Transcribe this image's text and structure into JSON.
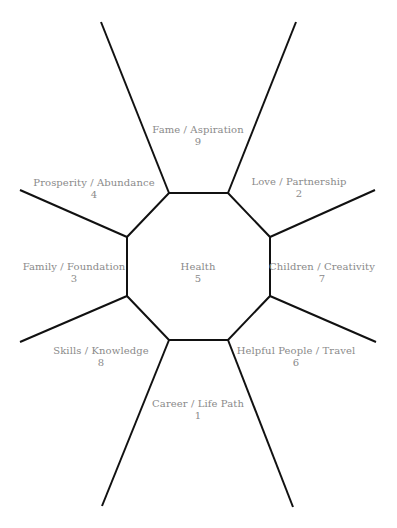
{
  "diagram": {
    "type": "bagua-map",
    "line_color": "#111111",
    "label_color": "#8a8a8a",
    "octagon_vertices": [
      [
        169,
        193
      ],
      [
        228,
        193
      ],
      [
        270,
        237
      ],
      [
        270,
        296
      ],
      [
        228,
        340
      ],
      [
        169,
        340
      ],
      [
        127,
        296
      ],
      [
        127,
        237
      ]
    ],
    "spokes": [
      {
        "from": [
          169,
          193
        ],
        "to": [
          101,
          22
        ]
      },
      {
        "from": [
          228,
          193
        ],
        "to": [
          296,
          22
        ]
      },
      {
        "from": [
          270,
          237
        ],
        "to": [
          375,
          190
        ]
      },
      {
        "from": [
          270,
          296
        ],
        "to": [
          376,
          342
        ]
      },
      {
        "from": [
          228,
          340
        ],
        "to": [
          293,
          507
        ]
      },
      {
        "from": [
          169,
          340
        ],
        "to": [
          102,
          506
        ]
      },
      {
        "from": [
          127,
          296
        ],
        "to": [
          20,
          342
        ]
      },
      {
        "from": [
          127,
          237
        ],
        "to": [
          20,
          190
        ]
      }
    ]
  },
  "zones": [
    {
      "id": "fame",
      "label": "Fame / Aspiration",
      "number": "9"
    },
    {
      "id": "love",
      "label": "Love / Partnership",
      "number": "2"
    },
    {
      "id": "prosperity",
      "label": "Prosperity / Abundance",
      "number": "4"
    },
    {
      "id": "family",
      "label": "Family / Foundation",
      "number": "3"
    },
    {
      "id": "health",
      "label": "Health",
      "number": "5"
    },
    {
      "id": "children",
      "label": "Children / Creativity",
      "number": "7"
    },
    {
      "id": "skills",
      "label": "Skills / Knowledge",
      "number": "8"
    },
    {
      "id": "helpful",
      "label": "Helpful People / Travel",
      "number": "6"
    },
    {
      "id": "career",
      "label": "Career / Life Path",
      "number": "1"
    }
  ]
}
